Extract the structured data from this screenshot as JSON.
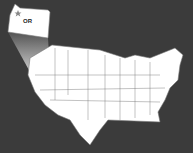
{
  "map": {
    "title": "United States map",
    "highlighted_state": {
      "abbr": "OR",
      "name": "Oregon",
      "capital_marker": "star-icon"
    },
    "colors": {
      "background": "#3b3b3b",
      "land": "#ffffff",
      "borders": "#555555",
      "capital_marker": "#888888"
    }
  }
}
